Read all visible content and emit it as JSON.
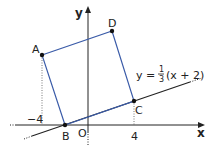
{
  "axes": {
    "x_label": "x",
    "y_label": "y",
    "origin_label": "O"
  },
  "ticks": {
    "neg4": "−4",
    "pos4": "4"
  },
  "points": {
    "A": {
      "label": "A",
      "x": -4
    },
    "B": {
      "label": "B"
    },
    "C": {
      "label": "C",
      "x": 4
    },
    "D": {
      "label": "D"
    }
  },
  "equation": {
    "prefix": "y =",
    "num": "1",
    "den": "3",
    "suffix": "(x + 2)"
  },
  "colors": {
    "square": "#3a5ba8",
    "line": "#222222",
    "axis": "#222222"
  }
}
